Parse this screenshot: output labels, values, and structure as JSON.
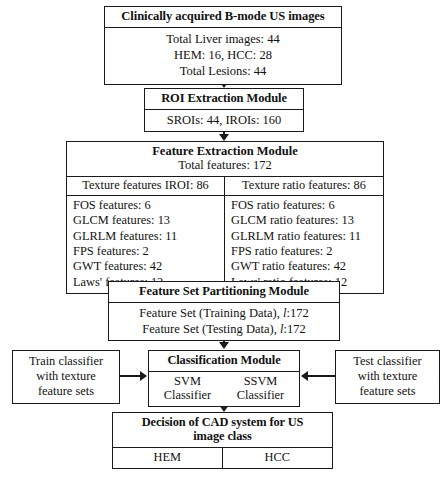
{
  "diagram": {
    "source_box": {
      "header": "Clinically acquired B-mode US images",
      "rows": [
        "Total Liver images: 44",
        "HEM: 16, HCC: 28",
        "Total Lesions: 44"
      ]
    },
    "roi_box": {
      "header": "ROI Extraction Module",
      "rows": [
        "SROIs: 44, IROIs: 160"
      ]
    },
    "feature_box": {
      "title": "Feature Extraction Module",
      "total": "Total features: 172",
      "left_column": {
        "header": "Texture features IROI: 86",
        "items": [
          "FOS features: 6",
          "GLCM features: 13",
          "GLRLM features: 11",
          "FPS features: 2",
          "GWT features: 42",
          "Laws' features: 12"
        ]
      },
      "right_column": {
        "header": "Texture ratio features: 86",
        "items": [
          "FOS ratio features: 6",
          "GLCM ratio features: 13",
          "GLRLM ratio features: 11",
          "FPS ratio features: 2",
          "GWT ratio features: 42",
          "Laws' ratio features: 12"
        ]
      }
    },
    "partition_box": {
      "header": "Feature Set Partitioning Module",
      "rows": [
        {
          "prefix": "Feature Set (Training Data), ",
          "symbol": "l",
          "suffix": ":172"
        },
        {
          "prefix": "Feature Set (Testing Data), ",
          "symbol": "l",
          "suffix": ":172"
        }
      ]
    },
    "classification_box": {
      "header": "Classification Module",
      "classifiers": [
        "SVM\nClassifier",
        "SSVM\nClassifier"
      ],
      "classifier_left_line1": "SVM",
      "classifier_left_line2": "Classifier",
      "classifier_right_line1": "SSVM",
      "classifier_right_line2": "Classifier"
    },
    "train_box": {
      "lines": [
        "Train classifier",
        "with texture",
        "feature sets"
      ]
    },
    "test_box": {
      "lines": [
        "Test classifier",
        "with texture",
        "feature sets"
      ]
    },
    "decision_box": {
      "header_line1": "Decision of CAD system for US",
      "header_line2": "image class",
      "classes": [
        "HEM",
        "HCC"
      ]
    },
    "caption": "",
    "colors": {
      "stroke": "#1a1a1a",
      "background": "#ffffff",
      "text": "#121212"
    }
  }
}
